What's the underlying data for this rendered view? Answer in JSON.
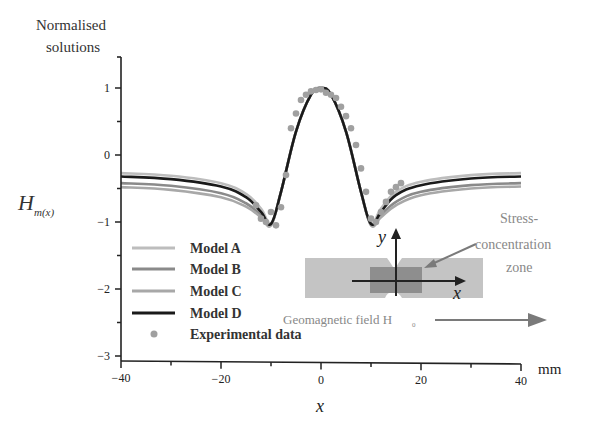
{
  "chart_data": {
    "type": "line",
    "title": "",
    "ylabel_top": [
      "Normalised",
      "solutions"
    ],
    "ylabel_symbol": "H",
    "ylabel_subscript": "m(x)",
    "xlabel": "x",
    "xunit": "mm",
    "xlim": [
      -40,
      40
    ],
    "ylim": [
      -3,
      1.4
    ],
    "xticks": [
      -40,
      -20,
      0,
      20,
      40
    ],
    "xtick_labels": [
      "-40",
      "-20",
      "0",
      "20",
      "40"
    ],
    "yticks": [
      -3,
      -2,
      -1,
      0,
      1
    ],
    "ytick_labels": [
      "-3",
      "-2",
      "-1",
      "0",
      "1"
    ],
    "grid": false,
    "legend_position": "bottom-left",
    "series": [
      {
        "name": "Model A",
        "color": "#bdbdbd",
        "x": [
          -40,
          -30,
          -20,
          -15,
          -12,
          -10,
          -8,
          -5,
          -2,
          0,
          2,
          5,
          8,
          10,
          12,
          15,
          20,
          30,
          40
        ],
        "y": [
          -0.27,
          -0.31,
          -0.42,
          -0.58,
          -0.8,
          -1.02,
          -0.55,
          0.35,
          0.9,
          1.0,
          0.9,
          0.35,
          -0.55,
          -1.02,
          -0.8,
          -0.55,
          -0.4,
          -0.3,
          -0.27
        ]
      },
      {
        "name": "Model B",
        "color": "#8a8a8a",
        "x": [
          -40,
          -30,
          -20,
          -15,
          -12,
          -10,
          -8,
          -5,
          -2,
          0,
          2,
          5,
          8,
          10,
          12,
          15,
          20,
          30,
          40
        ],
        "y": [
          -0.42,
          -0.46,
          -0.57,
          -0.72,
          -0.9,
          -1.04,
          -0.55,
          0.35,
          0.9,
          1.0,
          0.9,
          0.35,
          -0.55,
          -1.04,
          -0.9,
          -0.7,
          -0.55,
          -0.45,
          -0.42
        ]
      },
      {
        "name": "Model C",
        "color": "#a8a8a8",
        "x": [
          -40,
          -30,
          -20,
          -15,
          -12,
          -10,
          -8,
          -5,
          -2,
          0,
          2,
          5,
          8,
          10,
          12,
          15,
          20,
          30,
          40
        ],
        "y": [
          -0.48,
          -0.52,
          -0.63,
          -0.77,
          -0.93,
          -1.05,
          -0.55,
          0.35,
          0.9,
          1.0,
          0.9,
          0.35,
          -0.55,
          -1.05,
          -0.93,
          -0.75,
          -0.6,
          -0.5,
          -0.47
        ]
      },
      {
        "name": "Model D",
        "color": "#1a1a1a",
        "x": [
          -40,
          -30,
          -20,
          -15,
          -12,
          -10,
          -8,
          -5,
          -2,
          0,
          2,
          5,
          8,
          10,
          12,
          15,
          20,
          30,
          40
        ],
        "y": [
          -0.32,
          -0.36,
          -0.47,
          -0.63,
          -0.85,
          -1.03,
          -0.55,
          0.35,
          0.9,
          1.0,
          0.9,
          0.35,
          -0.55,
          -1.03,
          -0.85,
          -0.6,
          -0.45,
          -0.35,
          -0.32
        ]
      }
    ],
    "experimental": {
      "name": "Experimental data",
      "color": "#a0a0a0",
      "x": [
        -13,
        -12,
        -11,
        -10,
        -9,
        -8,
        -7,
        -6,
        -5,
        -4,
        -3,
        -2,
        -1,
        0,
        1,
        2,
        3,
        4,
        5,
        6,
        7,
        8,
        9,
        10,
        11,
        12,
        13,
        14,
        15,
        16
      ],
      "y": [
        -0.75,
        -0.95,
        -1.0,
        -0.85,
        -1.05,
        -0.78,
        -0.3,
        0.4,
        0.62,
        0.82,
        0.9,
        0.95,
        0.97,
        0.98,
        0.93,
        0.9,
        0.85,
        0.72,
        0.58,
        0.4,
        0.15,
        -0.2,
        -0.55,
        -0.95,
        -1.0,
        -0.85,
        -0.7,
        -0.55,
        -0.48,
        -0.42
      ]
    }
  },
  "inset": {
    "y_axis_label": "y",
    "x_axis_label": "x",
    "annotation": [
      "Stress-",
      "concentration",
      "zone"
    ],
    "field_label": "Geomagnetic field H",
    "field_subscript": "0",
    "colors": {
      "specimen": "#c4c4c4",
      "zone": "#8e8e8e",
      "arrow": "#7a7a7a"
    }
  }
}
